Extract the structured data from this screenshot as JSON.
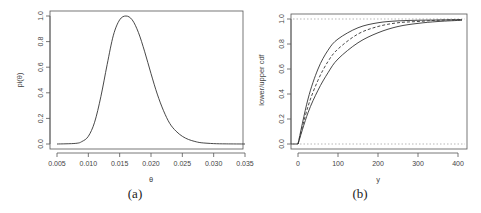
{
  "chart_data": [
    {
      "id": "a",
      "type": "line",
      "caption": "(a)",
      "title": "",
      "xlabel": "θ",
      "ylabel": "pi(θ)",
      "xlim": [
        0.005,
        0.035
      ],
      "ylim": [
        0.0,
        1.0
      ],
      "xticks": [
        "0.005",
        "0.010",
        "0.015",
        "0.020",
        "0.025",
        "0.030",
        "0.035"
      ],
      "yticks": [
        "0.0",
        "0.2",
        "0.4",
        "0.6",
        "0.8",
        "1.0"
      ],
      "grid": false,
      "series": [
        {
          "name": "pi(theta)",
          "style": "solid",
          "x": [
            0.005,
            0.008,
            0.009,
            0.01,
            0.011,
            0.012,
            0.013,
            0.014,
            0.015,
            0.016,
            0.017,
            0.018,
            0.019,
            0.02,
            0.021,
            0.022,
            0.023,
            0.024,
            0.025,
            0.026,
            0.027,
            0.028,
            0.03,
            0.032,
            0.035
          ],
          "values": [
            0.0,
            0.005,
            0.02,
            0.06,
            0.17,
            0.37,
            0.62,
            0.85,
            0.97,
            1.0,
            0.97,
            0.87,
            0.72,
            0.55,
            0.39,
            0.26,
            0.16,
            0.1,
            0.06,
            0.035,
            0.02,
            0.01,
            0.003,
            0.001,
            0.0
          ]
        }
      ]
    },
    {
      "id": "b",
      "type": "line",
      "caption": "(b)",
      "title": "",
      "xlabel": "y",
      "ylabel": "lower/upper cdf",
      "xlim": [
        0,
        410
      ],
      "ylim": [
        0.0,
        1.0
      ],
      "xticks": [
        "0",
        "100",
        "200",
        "300",
        "400"
      ],
      "yticks": [
        "0.0",
        "0.2",
        "0.4",
        "0.6",
        "0.8",
        "1.0"
      ],
      "grid": false,
      "reference_lines": [
        {
          "y": 0.0,
          "style": "dotted"
        },
        {
          "y": 1.0,
          "style": "dotted"
        }
      ],
      "series": [
        {
          "name": "upper cdf",
          "style": "solid",
          "x": [
            -20,
            0,
            25,
            50,
            75,
            100,
            150,
            200,
            250,
            300,
            350,
            410
          ],
          "values": [
            0.0,
            0.0,
            0.36,
            0.6,
            0.75,
            0.84,
            0.93,
            0.97,
            0.985,
            0.99,
            0.992,
            0.995
          ]
        },
        {
          "name": "estimate cdf",
          "style": "dashed",
          "x": [
            0,
            25,
            50,
            75,
            100,
            150,
            200,
            250,
            300,
            350,
            410
          ],
          "values": [
            0.0,
            0.3,
            0.51,
            0.66,
            0.76,
            0.88,
            0.94,
            0.97,
            0.98,
            0.99,
            0.995
          ]
        },
        {
          "name": "lower cdf",
          "style": "solid",
          "x": [
            0,
            25,
            50,
            75,
            100,
            150,
            200,
            250,
            300,
            350,
            410
          ],
          "values": [
            0.0,
            0.25,
            0.43,
            0.57,
            0.68,
            0.81,
            0.89,
            0.94,
            0.965,
            0.98,
            0.99
          ]
        }
      ]
    }
  ]
}
